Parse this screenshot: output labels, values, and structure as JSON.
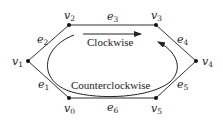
{
  "diagram": {
    "type": "cycle-graph",
    "colors": {
      "stroke": "#333333",
      "vertex": "#111111",
      "text": "#222222"
    },
    "vertices": [
      {
        "id": "v0",
        "base": "v",
        "sub": "0",
        "x": 69,
        "y": 98
      },
      {
        "id": "v1",
        "base": "v",
        "sub": "1",
        "x": 28,
        "y": 61
      },
      {
        "id": "v2",
        "base": "v",
        "sub": "2",
        "x": 69,
        "y": 25
      },
      {
        "id": "v3",
        "base": "v",
        "sub": "3",
        "x": 156,
        "y": 25
      },
      {
        "id": "v4",
        "base": "v",
        "sub": "4",
        "x": 196,
        "y": 61
      },
      {
        "id": "v5",
        "base": "v",
        "sub": "5",
        "x": 156,
        "y": 98
      }
    ],
    "edges": [
      {
        "id": "e1",
        "base": "e",
        "sub": "1",
        "from": "v0",
        "to": "v1"
      },
      {
        "id": "e2",
        "base": "e",
        "sub": "2",
        "from": "v1",
        "to": "v2"
      },
      {
        "id": "e3",
        "base": "e",
        "sub": "3",
        "from": "v2",
        "to": "v3"
      },
      {
        "id": "e4",
        "base": "e",
        "sub": "4",
        "from": "v3",
        "to": "v4"
      },
      {
        "id": "e5",
        "base": "e",
        "sub": "5",
        "from": "v4",
        "to": "v5"
      },
      {
        "id": "e6",
        "base": "e",
        "sub": "6",
        "from": "v5",
        "to": "v0"
      }
    ],
    "arrows": {
      "clockwise": {
        "label": "Clockwise"
      },
      "counterclockwise": {
        "label": "Counterclockwise"
      }
    }
  }
}
